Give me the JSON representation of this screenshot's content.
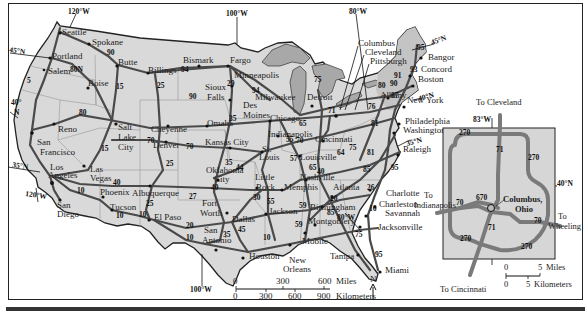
{
  "map": {
    "title": "Interstate Highway Map of the United States",
    "colors": {
      "land": "#d9d9d9",
      "water": "#a8a8a8",
      "road": "#4a4a4a",
      "inset_road": "#7a7a7a",
      "border": "#222222"
    },
    "coordinates": {
      "lon_120_top": "120°W",
      "lon_100_top": "100°W",
      "lon_80_top": "80°W",
      "lat_45_w": "45°N",
      "lat_40_w": "40°",
      "lat_40_w_n": "N",
      "lat_35_w": "35°N",
      "lon_120_bottom": "120°W",
      "lon_100_bottom": "100°W",
      "lat_45_e": "45°N",
      "lat_40_e": "40°N",
      "lat_35_e": "35°N",
      "lon_80_bottom": "80°W"
    },
    "cities": [
      {
        "name": "Seattle",
        "x": 62,
        "y": 35
      },
      {
        "name": "Spokane",
        "x": 92,
        "y": 45
      },
      {
        "name": "Portland",
        "x": 52,
        "y": 59
      },
      {
        "name": "Salem",
        "x": 48,
        "y": 74
      },
      {
        "name": "Butte",
        "x": 118,
        "y": 65
      },
      {
        "name": "Billings",
        "x": 148,
        "y": 73
      },
      {
        "name": "Bismark",
        "x": 183,
        "y": 63
      },
      {
        "name": "Fargo",
        "x": 230,
        "y": 63
      },
      {
        "name": "Minneapolis",
        "x": 234,
        "y": 78
      },
      {
        "name": "Boise",
        "x": 88,
        "y": 86
      },
      {
        "name": "Sioux",
        "x": 205,
        "y": 90
      },
      {
        "name": "Falls",
        "x": 207,
        "y": 100
      },
      {
        "name": "Milwaukee",
        "x": 255,
        "y": 100
      },
      {
        "name": "Des",
        "x": 243,
        "y": 108
      },
      {
        "name": "Moines",
        "x": 243,
        "y": 118
      },
      {
        "name": "Chicago",
        "x": 270,
        "y": 121
      },
      {
        "name": "Detroit",
        "x": 307,
        "y": 100
      },
      {
        "name": "Reno",
        "x": 58,
        "y": 132
      },
      {
        "name": "Salt",
        "x": 118,
        "y": 130
      },
      {
        "name": "Lake",
        "x": 118,
        "y": 140
      },
      {
        "name": "City",
        "x": 118,
        "y": 150
      },
      {
        "name": "Cheyenne",
        "x": 151,
        "y": 132
      },
      {
        "name": "Denver",
        "x": 153,
        "y": 148
      },
      {
        "name": "Omaha",
        "x": 207,
        "y": 126
      },
      {
        "name": "Kansas City",
        "x": 205,
        "y": 145
      },
      {
        "name": "Indianapolis",
        "x": 268,
        "y": 137
      },
      {
        "name": "Cincinnati",
        "x": 315,
        "y": 142
      },
      {
        "name": "St.",
        "x": 262,
        "y": 152
      },
      {
        "name": "Louis",
        "x": 259,
        "y": 160
      },
      {
        "name": "Louisville",
        "x": 300,
        "y": 160
      },
      {
        "name": "San",
        "x": 37,
        "y": 145
      },
      {
        "name": "Francisco",
        "x": 40,
        "y": 155
      },
      {
        "name": "Las",
        "x": 90,
        "y": 172
      },
      {
        "name": "Vegas",
        "x": 90,
        "y": 181
      },
      {
        "name": "Los",
        "x": 50,
        "y": 170
      },
      {
        "name": "Angeles",
        "x": 48,
        "y": 178
      },
      {
        "name": "Oklahoma",
        "x": 206,
        "y": 173
      },
      {
        "name": "City",
        "x": 214,
        "y": 182
      },
      {
        "name": "Little",
        "x": 255,
        "y": 180
      },
      {
        "name": "Rock",
        "x": 256,
        "y": 190
      },
      {
        "name": "Nashville",
        "x": 300,
        "y": 180
      },
      {
        "name": "Memphis",
        "x": 284,
        "y": 190
      },
      {
        "name": "Atlanta",
        "x": 333,
        "y": 190
      },
      {
        "name": "Phoenix",
        "x": 100,
        "y": 195
      },
      {
        "name": "Albuquerque",
        "x": 132,
        "y": 196
      },
      {
        "name": "Fort",
        "x": 202,
        "y": 206
      },
      {
        "name": "Worth",
        "x": 200,
        "y": 216
      },
      {
        "name": "Dallas",
        "x": 232,
        "y": 222
      },
      {
        "name": "San",
        "x": 57,
        "y": 208
      },
      {
        "name": "Diego",
        "x": 57,
        "y": 217
      },
      {
        "name": "Tucson",
        "x": 110,
        "y": 210
      },
      {
        "name": "El Paso",
        "x": 154,
        "y": 220
      },
      {
        "name": "Jackson",
        "x": 269,
        "y": 214
      },
      {
        "name": "Birmingham",
        "x": 310,
        "y": 210
      },
      {
        "name": "Montgomery",
        "x": 308,
        "y": 224
      },
      {
        "name": "San",
        "x": 204,
        "y": 233
      },
      {
        "name": "Antonio",
        "x": 202,
        "y": 243
      },
      {
        "name": "Houston",
        "x": 249,
        "y": 259
      },
      {
        "name": "New",
        "x": 289,
        "y": 263
      },
      {
        "name": "Orleans",
        "x": 283,
        "y": 272
      },
      {
        "name": "Mobile",
        "x": 302,
        "y": 244
      },
      {
        "name": "Tampa",
        "x": 330,
        "y": 259
      },
      {
        "name": "Jacksonville",
        "x": 378,
        "y": 230
      },
      {
        "name": "Miami",
        "x": 385,
        "y": 273
      },
      {
        "name": "Charlotte",
        "x": 386,
        "y": 196
      },
      {
        "name": "Charleston",
        "x": 379,
        "y": 207
      },
      {
        "name": "Savannah",
        "x": 385,
        "y": 216
      },
      {
        "name": "Raleigh",
        "x": 403,
        "y": 152
      },
      {
        "name": "Washington",
        "x": 403,
        "y": 133
      },
      {
        "name": "Philadelphia",
        "x": 405,
        "y": 124
      },
      {
        "name": "New York",
        "x": 407,
        "y": 103
      },
      {
        "name": "Boston",
        "x": 418,
        "y": 82
      },
      {
        "name": "Concord",
        "x": 421,
        "y": 72
      },
      {
        "name": "Bangor",
        "x": 428,
        "y": 60
      },
      {
        "name": "Albany",
        "x": 380,
        "y": 98
      },
      {
        "name": "Columbus",
        "x": 358,
        "y": 46
      },
      {
        "name": "Cleveland",
        "x": 365,
        "y": 55
      },
      {
        "name": "Pittsburgh",
        "x": 370,
        "y": 64
      }
    ],
    "routes": [
      {
        "num": "5",
        "x": 27,
        "y": 83
      },
      {
        "num": "80N",
        "x": 70,
        "y": 72
      },
      {
        "num": "90",
        "x": 107,
        "y": 55
      },
      {
        "num": "15",
        "x": 116,
        "y": 89
      },
      {
        "num": "94",
        "x": 181,
        "y": 72
      },
      {
        "name": "25a",
        "num": "25",
        "x": 157,
        "y": 88
      },
      {
        "num": "90",
        "x": 189,
        "y": 99
      },
      {
        "num": "29",
        "x": 227,
        "y": 86
      },
      {
        "num": "94",
        "x": 252,
        "y": 93
      },
      {
        "num": "35",
        "x": 229,
        "y": 121
      },
      {
        "num": "80",
        "x": 79,
        "y": 115
      },
      {
        "num": "15",
        "x": 101,
        "y": 151
      },
      {
        "num": "70",
        "x": 147,
        "y": 143
      },
      {
        "num": "70",
        "x": 186,
        "y": 149
      },
      {
        "num": "25",
        "x": 166,
        "y": 166
      },
      {
        "num": "65",
        "x": 299,
        "y": 126
      },
      {
        "num": "70",
        "x": 296,
        "y": 143
      },
      {
        "num": "55",
        "x": 286,
        "y": 142
      },
      {
        "num": "57",
        "x": 290,
        "y": 161
      },
      {
        "num": "64",
        "x": 337,
        "y": 155
      },
      {
        "num": "65",
        "x": 309,
        "y": 170
      },
      {
        "num": "40",
        "x": 317,
        "y": 174
      },
      {
        "num": "75",
        "x": 349,
        "y": 150
      },
      {
        "num": "81",
        "x": 367,
        "y": 155
      },
      {
        "num": "85",
        "x": 363,
        "y": 172
      },
      {
        "num": "95",
        "x": 391,
        "y": 170
      },
      {
        "num": "26",
        "x": 367,
        "y": 190
      },
      {
        "num": "20",
        "x": 330,
        "y": 201
      },
      {
        "num": "40",
        "x": 113,
        "y": 185
      },
      {
        "num": "10",
        "x": 77,
        "y": 193
      },
      {
        "num": "10",
        "x": 116,
        "y": 218
      },
      {
        "num": "10",
        "x": 139,
        "y": 217
      },
      {
        "num": "25",
        "x": 146,
        "y": 206
      },
      {
        "num": "27",
        "x": 189,
        "y": 199
      },
      {
        "num": "40",
        "x": 211,
        "y": 190
      },
      {
        "num": "44",
        "x": 236,
        "y": 170
      },
      {
        "num": "35",
        "x": 225,
        "y": 165
      },
      {
        "num": "30",
        "x": 253,
        "y": 200
      },
      {
        "num": "20",
        "x": 186,
        "y": 228
      },
      {
        "name": "10b",
        "num": "10",
        "x": 186,
        "y": 240
      },
      {
        "num": "35",
        "x": 223,
        "y": 237
      },
      {
        "num": "45",
        "x": 238,
        "y": 232
      },
      {
        "num": "55",
        "x": 267,
        "y": 204
      },
      {
        "num": "59",
        "x": 299,
        "y": 208
      },
      {
        "num": "85",
        "x": 327,
        "y": 215
      },
      {
        "num": "16",
        "x": 369,
        "y": 211
      },
      {
        "num": "10",
        "x": 263,
        "y": 240
      },
      {
        "num": "59",
        "x": 295,
        "y": 227
      },
      {
        "num": "75",
        "x": 355,
        "y": 237
      },
      {
        "num": "95",
        "x": 375,
        "y": 257
      },
      {
        "num": "75",
        "x": 314,
        "y": 82
      },
      {
        "num": "80",
        "x": 378,
        "y": 88
      },
      {
        "num": "87",
        "x": 391,
        "y": 98
      },
      {
        "num": "90",
        "x": 390,
        "y": 86
      },
      {
        "num": "91",
        "x": 394,
        "y": 78
      },
      {
        "num": "93",
        "x": 410,
        "y": 72
      },
      {
        "num": "95",
        "x": 417,
        "y": 50
      },
      {
        "num": "71",
        "x": 328,
        "y": 113
      },
      {
        "num": "81",
        "x": 371,
        "y": 126
      },
      {
        "num": "76",
        "x": 368,
        "y": 109
      }
    ],
    "scale": {
      "miles_ticks": [
        "0",
        "300",
        "600"
      ],
      "miles_label": "Miles",
      "km_ticks": [
        "0",
        "300",
        "600",
        "900"
      ],
      "km_label": "Kilometers"
    },
    "north_arrow": "N"
  },
  "inset": {
    "title": "Columbus,",
    "title2": "Ohio",
    "to_cleveland": "To Cleveland",
    "to_indianapolis_1": "To",
    "to_indianapolis_2": "Indianapolis",
    "to_wheeling_1": "To",
    "to_wheeling_2": "Wheeling",
    "to_cincinnati": "To Cincinnati",
    "lon": "83°W",
    "lat": "40°N",
    "routes": [
      {
        "num": "270",
        "x": 459,
        "y": 135
      },
      {
        "num": "71",
        "x": 496,
        "y": 152
      },
      {
        "num": "270",
        "x": 528,
        "y": 160
      },
      {
        "num": "670",
        "x": 476,
        "y": 200
      },
      {
        "num": "70",
        "x": 456,
        "y": 205
      },
      {
        "num": "70",
        "x": 534,
        "y": 223
      },
      {
        "num": "71",
        "x": 488,
        "y": 230
      },
      {
        "num": "270",
        "x": 460,
        "y": 241
      },
      {
        "num": "270",
        "x": 521,
        "y": 249
      }
    ],
    "scale": {
      "miles_ticks": [
        "0",
        "5"
      ],
      "miles_label": "Miles",
      "km_ticks": [
        "0",
        "5"
      ],
      "km_label": "Kilometers"
    }
  }
}
